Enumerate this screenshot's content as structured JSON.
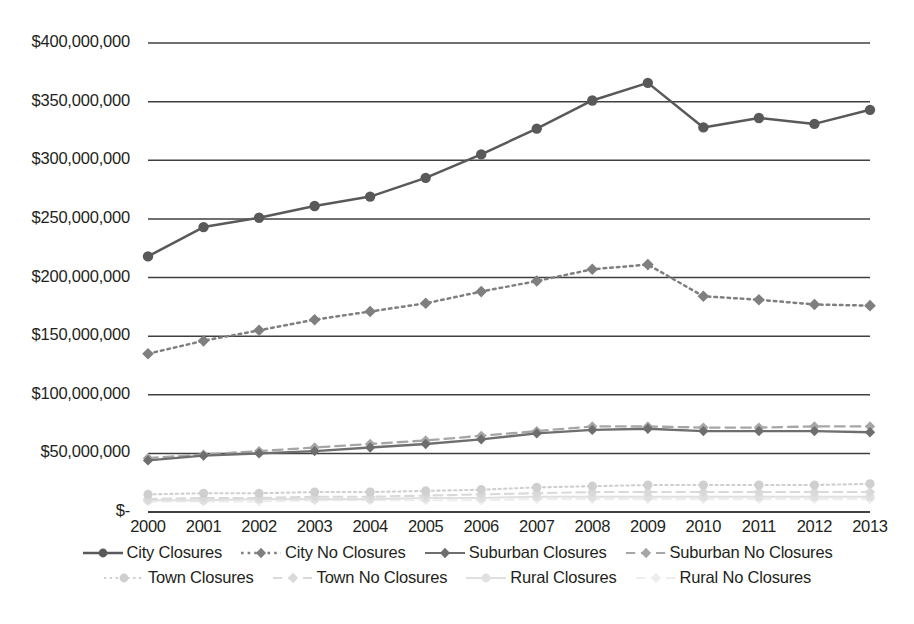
{
  "chart_data": {
    "type": "line",
    "title": "",
    "xlabel": "",
    "ylabel": "",
    "grid": true,
    "legend_position": "bottom",
    "categories": [
      "2000",
      "2001",
      "2002",
      "2003",
      "2004",
      "2005",
      "2006",
      "2007",
      "2008",
      "2009",
      "2010",
      "2011",
      "2012",
      "2013"
    ],
    "ylim": [
      0,
      400000000
    ],
    "ytick_labels": [
      "$400,000,000",
      "$350,000,000",
      "$300,000,000",
      "$250,000,000",
      "$200,000,000",
      "$150,000,000",
      "$100,000,000",
      "$50,000,000",
      "$-"
    ],
    "ytick_values": [
      400000000,
      350000000,
      300000000,
      250000000,
      200000000,
      150000000,
      100000000,
      50000000,
      0
    ],
    "series": [
      {
        "name": "City Closures",
        "color": "#595959",
        "dash": "solid",
        "marker": "circle",
        "values": [
          218000000,
          243000000,
          251000000,
          261000000,
          269000000,
          285000000,
          305000000,
          327000000,
          351000000,
          366000000,
          328000000,
          336000000,
          331000000,
          343000000
        ]
      },
      {
        "name": "City No Closures",
        "color": "#7f7f7f",
        "dash": "dotted",
        "marker": "diamond",
        "values": [
          135000000,
          146000000,
          155000000,
          164000000,
          171000000,
          178000000,
          188000000,
          197000000,
          207000000,
          211000000,
          184000000,
          181000000,
          177000000,
          176000000
        ]
      },
      {
        "name": "Suburban Closures",
        "color": "#6e6e6e",
        "dash": "solid",
        "marker": "diamond",
        "values": [
          44000000,
          48000000,
          50000000,
          52000000,
          55000000,
          58000000,
          62000000,
          67000000,
          70000000,
          71000000,
          69000000,
          69000000,
          69000000,
          68000000
        ]
      },
      {
        "name": "Suburban No Closures",
        "color": "#a6a6a6",
        "dash": "dashed",
        "marker": "diamond",
        "values": [
          46000000,
          49000000,
          52000000,
          55000000,
          58000000,
          61000000,
          65000000,
          69000000,
          73000000,
          73000000,
          72000000,
          72000000,
          73000000,
          73000000
        ]
      },
      {
        "name": "Town Closures",
        "color": "#cfcfcf",
        "dash": "dotted",
        "marker": "circle",
        "values": [
          15000000,
          16000000,
          16000000,
          17000000,
          17000000,
          18000000,
          19000000,
          21000000,
          22000000,
          23000000,
          23000000,
          23000000,
          23000000,
          24000000
        ]
      },
      {
        "name": "Town No Closures",
        "color": "#d9d9d9",
        "dash": "dashed",
        "marker": "diamond",
        "values": [
          11000000,
          12000000,
          12000000,
          13000000,
          13000000,
          14000000,
          15000000,
          16000000,
          17000000,
          17000000,
          17000000,
          17000000,
          17000000,
          17000000
        ]
      },
      {
        "name": "Rural Closures",
        "color": "#e0e0e0",
        "dash": "solid",
        "marker": "circle",
        "values": [
          10000000,
          10000000,
          11000000,
          11000000,
          11000000,
          12000000,
          12000000,
          13000000,
          13000000,
          13000000,
          13000000,
          13000000,
          13000000,
          13000000
        ]
      },
      {
        "name": "Rural No Closures",
        "color": "#ededed",
        "dash": "dashed",
        "marker": "diamond",
        "values": [
          9000000,
          9000000,
          9000000,
          10000000,
          10000000,
          10000000,
          10000000,
          11000000,
          11000000,
          11000000,
          11000000,
          11000000,
          11000000,
          11000000
        ]
      }
    ]
  }
}
